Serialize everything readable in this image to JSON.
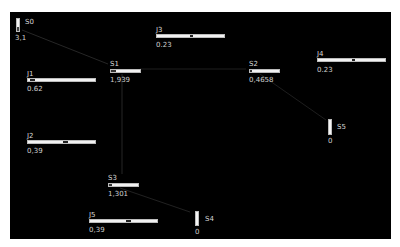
{
  "colors": {
    "background": "#000000",
    "wire": "#2a2a2a",
    "control_fill": "#f2f2f2",
    "knob": "#222222",
    "text": "#d8d8d8"
  },
  "nodes": {
    "S0": {
      "label": "S0",
      "value": "3,1",
      "kind": "vertical-meter"
    },
    "S1": {
      "label": "S1",
      "value": "1,939",
      "kind": "horizontal-meter"
    },
    "S2": {
      "label": "S2",
      "value": "0,4658",
      "kind": "horizontal-meter"
    },
    "S3": {
      "label": "S3",
      "value": "1,301",
      "kind": "horizontal-meter"
    },
    "S4": {
      "label": "S4",
      "value": "0",
      "kind": "vertical-meter"
    },
    "S5": {
      "label": "S5",
      "value": "0",
      "kind": "vertical-meter"
    },
    "J1": {
      "label": "J1",
      "value": "0.62",
      "kind": "slider"
    },
    "J2": {
      "label": "J2",
      "value": "0,39",
      "kind": "slider"
    },
    "J3": {
      "label": "J3",
      "value": "0.23",
      "kind": "slider"
    },
    "J4": {
      "label": "J4",
      "value": "0.23",
      "kind": "slider"
    },
    "J5": {
      "label": "J5",
      "value": "0,39",
      "kind": "slider"
    }
  },
  "edges": [
    {
      "from": "S0",
      "to": "S1"
    },
    {
      "from": "S1",
      "to": "S2"
    },
    {
      "from": "S1",
      "to": "S3"
    },
    {
      "from": "S2",
      "to": "S5"
    },
    {
      "from": "S3",
      "to": "S4"
    }
  ]
}
